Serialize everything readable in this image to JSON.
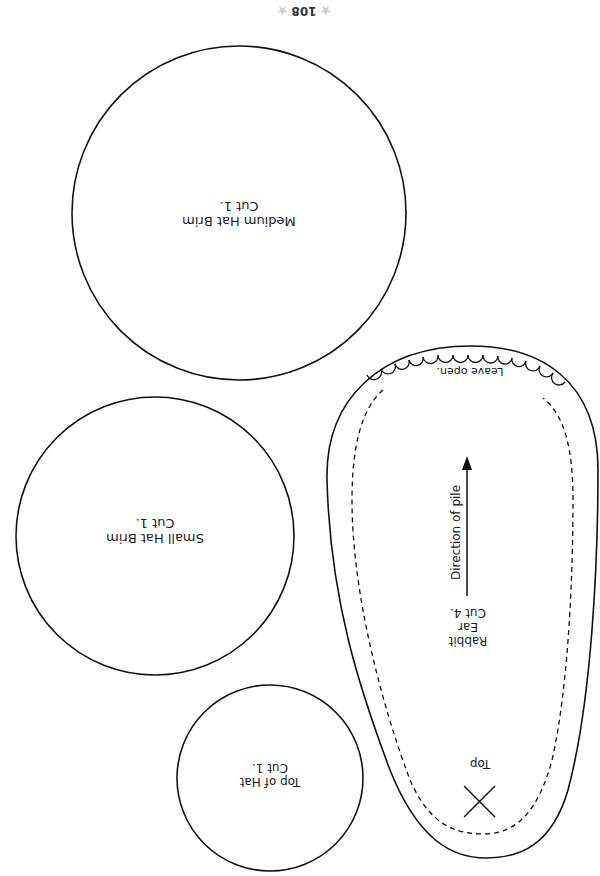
{
  "page": {
    "page_number": "108",
    "orientation": "rotated 180°",
    "decoration": "star-icon"
  },
  "pattern_pieces": [
    {
      "id": "medium-hat-brim",
      "shape": "circle",
      "name": "Medium Hat Brim",
      "instruction": "Cut 1."
    },
    {
      "id": "small-hat-brim",
      "shape": "circle",
      "name": "Small Hat Brim",
      "instruction": "Cut 1."
    },
    {
      "id": "top-of-hat",
      "shape": "circle",
      "name": "Top of Hat",
      "instruction": "Cut 1."
    },
    {
      "id": "rabbit-ear",
      "shape": "teardrop",
      "name_line1": "Rabbit",
      "name_line2": "Ear",
      "instruction": "Cut 4.",
      "opening_label": "Leave open.",
      "grain_label": "Direction of pile",
      "marker_label": "Top",
      "marker": "x-mark"
    }
  ],
  "colors": {
    "line": "#111111",
    "background": "#ffffff",
    "star": "#cfcfcf"
  }
}
